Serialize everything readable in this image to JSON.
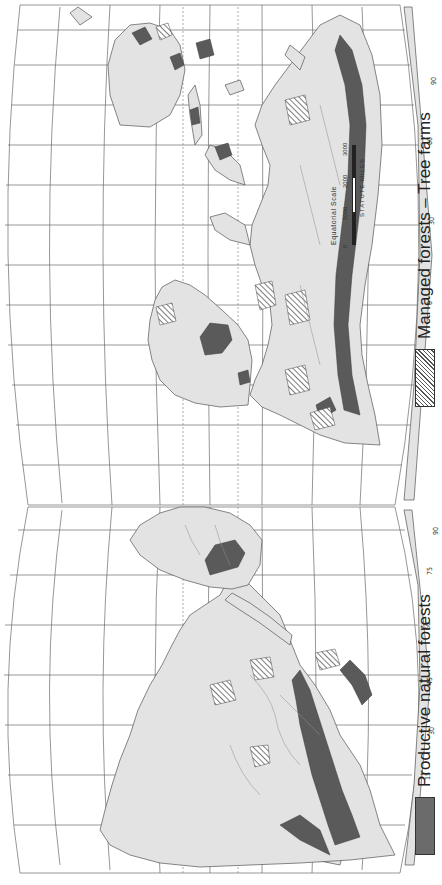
{
  "map": {
    "title": "World forest resources map",
    "orientation": "rotated -90 degrees",
    "colors": {
      "land": "#e3e3e3",
      "productive_forest": "#5a5a5a",
      "ocean": "#ffffff",
      "grid": "#6a6a6a"
    }
  },
  "legend": {
    "items": [
      {
        "label": "Productive natural forests",
        "swatch": "solid-dark-gray"
      },
      {
        "label": "Managed forests – Tree farms",
        "swatch": "diagonal-hatch"
      }
    ]
  },
  "scale": {
    "title": "Equatorial Scale",
    "ticks": [
      "0",
      "1000",
      "2000",
      "3000"
    ],
    "units": "STATUTE MILES"
  },
  "labels": {
    "west_lat": [
      "90",
      "75",
      "60",
      "45",
      "30",
      "15",
      "0",
      "15",
      "30",
      "45",
      "60",
      "75",
      "90"
    ],
    "west_lon_top": [
      "90",
      "180",
      "150",
      "120",
      "90",
      "60",
      "30",
      "10",
      "90"
    ],
    "west_lon_bottom": [
      "90",
      "180",
      "150",
      "120",
      "90",
      "60",
      "30",
      "90"
    ],
    "west_meridians": [
      "180",
      "165",
      "150",
      "135",
      "120",
      "105",
      "90"
    ],
    "east_lat": [
      "90",
      "75",
      "60",
      "45",
      "30",
      "15",
      "0",
      "15",
      "30",
      "45",
      "60",
      "75",
      "90"
    ],
    "east_lon_top": [
      "90",
      "30",
      "0",
      "30",
      "60",
      "90",
      "120",
      "150",
      "180",
      "90"
    ],
    "east_lon_bottom": [
      "90",
      "0",
      "30",
      "60",
      "90",
      "120",
      "150",
      "180",
      "90"
    ],
    "east_meridians": [
      "0",
      "15",
      "30",
      "45",
      "60",
      "75",
      "90",
      "105",
      "120",
      "135",
      "150",
      "165",
      "180"
    ]
  }
}
